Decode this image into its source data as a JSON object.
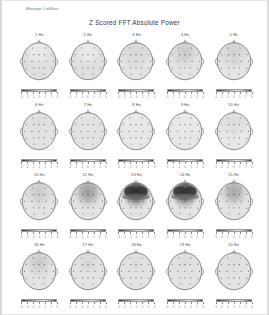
{
  "header": {
    "montage_label": "Montage:  LinkEars",
    "title": "Z Scored FFT Absolute Power"
  },
  "colorbar": {
    "tick_labels": [
      "-3",
      "-2",
      "-1",
      "0",
      "1",
      "2",
      "3"
    ],
    "min": -3,
    "max": 3,
    "unit": "z",
    "low_color": "#2f2f2f",
    "mid_color": "#e6e6e6",
    "high_color": "#3a3a3a"
  },
  "electrodes": [
    {
      "name": "Fp1",
      "x": 36,
      "y": 22
    },
    {
      "name": "Fp2",
      "x": 64,
      "y": 22
    },
    {
      "name": "F7",
      "x": 21,
      "y": 36
    },
    {
      "name": "F3",
      "x": 38,
      "y": 37
    },
    {
      "name": "Fz",
      "x": 50,
      "y": 37
    },
    {
      "name": "F4",
      "x": 62,
      "y": 37
    },
    {
      "name": "F8",
      "x": 79,
      "y": 36
    },
    {
      "name": "T3",
      "x": 17,
      "y": 52
    },
    {
      "name": "C3",
      "x": 34,
      "y": 52
    },
    {
      "name": "Cz",
      "x": 50,
      "y": 52
    },
    {
      "name": "C4",
      "x": 66,
      "y": 52
    },
    {
      "name": "T4",
      "x": 83,
      "y": 52
    },
    {
      "name": "T5",
      "x": 21,
      "y": 68
    },
    {
      "name": "P3",
      "x": 38,
      "y": 67
    },
    {
      "name": "Pz",
      "x": 50,
      "y": 67
    },
    {
      "name": "P4",
      "x": 62,
      "y": 67
    },
    {
      "name": "T6",
      "x": 79,
      "y": 68
    },
    {
      "name": "O1",
      "x": 39,
      "y": 81
    },
    {
      "name": "O2",
      "x": 61,
      "y": 81
    }
  ],
  "chart_data": {
    "type": "heatmap",
    "title": "Z Scored FFT Absolute Power",
    "subtitle": "Montage:  LinkEars",
    "layout": {
      "rows": 4,
      "cols": 5,
      "grid": true,
      "legend": "per-panel colorbar below each head map"
    },
    "xlabel": "",
    "ylabel": "",
    "zlim": [
      -3,
      3
    ],
    "zlabel": "Z-score",
    "panel_label_suffix": "Hz",
    "panels": [
      {
        "label": "1 Hz",
        "freq": 1,
        "overall_z": 0.2,
        "pattern": "diffuse mild, slight posterior elevation",
        "region_z": {
          "frontal": 0.1,
          "central": 0.2,
          "temporal": 0.1,
          "parietal": 0.3,
          "occipital": 0.3
        }
      },
      {
        "label": "2 Hz",
        "freq": 2,
        "overall_z": 0.2,
        "pattern": "diffuse mild",
        "region_z": {
          "frontal": 0.1,
          "central": 0.2,
          "temporal": 0.1,
          "parietal": 0.3,
          "occipital": 0.3
        }
      },
      {
        "label": "3 Hz",
        "freq": 3,
        "overall_z": 0.3,
        "pattern": "diffuse mild, faint frontal",
        "region_z": {
          "frontal": 0.4,
          "central": 0.3,
          "temporal": 0.2,
          "parietal": 0.2,
          "occipital": 0.2
        }
      },
      {
        "label": "4 Hz",
        "freq": 4,
        "overall_z": 0.4,
        "pattern": "faint frontal elevation",
        "region_z": {
          "frontal": 0.6,
          "central": 0.3,
          "temporal": 0.2,
          "parietal": 0.2,
          "occipital": 0.2
        }
      },
      {
        "label": "5 Hz",
        "freq": 5,
        "overall_z": 0.3,
        "pattern": "faint frontal elevation",
        "region_z": {
          "frontal": 0.5,
          "central": 0.3,
          "temporal": 0.2,
          "parietal": 0.2,
          "occipital": 0.2
        }
      },
      {
        "label": "6 Hz",
        "freq": 6,
        "overall_z": 0.2,
        "pattern": "diffuse mild",
        "region_z": {
          "frontal": 0.3,
          "central": 0.2,
          "temporal": 0.2,
          "parietal": 0.2,
          "occipital": 0.2
        }
      },
      {
        "label": "7 Hz",
        "freq": 7,
        "overall_z": 0.2,
        "pattern": "diffuse mild",
        "region_z": {
          "frontal": 0.2,
          "central": 0.2,
          "temporal": 0.2,
          "parietal": 0.2,
          "occipital": 0.2
        }
      },
      {
        "label": "8 Hz",
        "freq": 8,
        "overall_z": 0.1,
        "pattern": "near normal",
        "region_z": {
          "frontal": 0.1,
          "central": 0.1,
          "temporal": 0.1,
          "parietal": 0.1,
          "occipital": 0.1
        }
      },
      {
        "label": "9 Hz",
        "freq": 9,
        "overall_z": 0.1,
        "pattern": "near normal",
        "region_z": {
          "frontal": 0.1,
          "central": 0.1,
          "temporal": 0.1,
          "parietal": 0.1,
          "occipital": 0.1
        }
      },
      {
        "label": "10 Hz",
        "freq": 10,
        "overall_z": 0.2,
        "pattern": "near normal, mild frontal",
        "region_z": {
          "frontal": 0.3,
          "central": 0.2,
          "temporal": 0.1,
          "parietal": 0.1,
          "occipital": 0.1
        }
      },
      {
        "label": "11 Hz",
        "freq": 11,
        "overall_z": 0.3,
        "pattern": "mild frontal elevation",
        "region_z": {
          "frontal": 0.6,
          "central": 0.3,
          "temporal": 0.2,
          "parietal": 0.2,
          "occipital": 0.2
        }
      },
      {
        "label": "12 Hz",
        "freq": 12,
        "overall_z": 0.7,
        "pattern": "moderate frontal elevation",
        "region_z": {
          "frontal": 1.3,
          "central": 0.5,
          "temporal": 0.3,
          "parietal": 0.2,
          "occipital": 0.2
        }
      },
      {
        "label": "13 Hz",
        "freq": 13,
        "overall_z": 1.6,
        "pattern": "marked frontal / prefrontal elevation",
        "region_z": {
          "frontal": 2.9,
          "central": 1.0,
          "temporal": 0.6,
          "parietal": 0.3,
          "occipital": 0.2
        }
      },
      {
        "label": "14 Hz",
        "freq": 14,
        "overall_z": 1.5,
        "pattern": "marked bifrontal elevation",
        "region_z": {
          "frontal": 2.8,
          "central": 0.9,
          "temporal": 0.6,
          "parietal": 0.3,
          "occipital": 0.2
        }
      },
      {
        "label": "15 Hz",
        "freq": 15,
        "overall_z": 0.6,
        "pattern": "mild frontal elevation",
        "region_z": {
          "frontal": 1.1,
          "central": 0.4,
          "temporal": 0.3,
          "parietal": 0.2,
          "occipital": 0.2
        }
      },
      {
        "label": "16 Hz",
        "freq": 16,
        "overall_z": 0.3,
        "pattern": "mild frontal",
        "region_z": {
          "frontal": 0.6,
          "central": 0.3,
          "temporal": 0.2,
          "parietal": 0.2,
          "occipital": 0.2
        }
      },
      {
        "label": "17 Hz",
        "freq": 17,
        "overall_z": 0.2,
        "pattern": "near normal",
        "region_z": {
          "frontal": 0.4,
          "central": 0.2,
          "temporal": 0.2,
          "parietal": 0.2,
          "occipital": 0.2
        }
      },
      {
        "label": "18 Hz",
        "freq": 18,
        "overall_z": 0.2,
        "pattern": "near normal",
        "region_z": {
          "frontal": 0.3,
          "central": 0.2,
          "temporal": 0.2,
          "parietal": 0.2,
          "occipital": 0.2
        }
      },
      {
        "label": "19 Hz",
        "freq": 19,
        "overall_z": 0.2,
        "pattern": "near normal",
        "region_z": {
          "frontal": 0.3,
          "central": 0.2,
          "temporal": 0.2,
          "parietal": 0.2,
          "occipital": 0.2
        }
      },
      {
        "label": "20 Hz",
        "freq": 20,
        "overall_z": 0.2,
        "pattern": "near normal",
        "region_z": {
          "frontal": 0.3,
          "central": 0.2,
          "temporal": 0.2,
          "parietal": 0.2,
          "occipital": 0.2
        }
      }
    ]
  }
}
